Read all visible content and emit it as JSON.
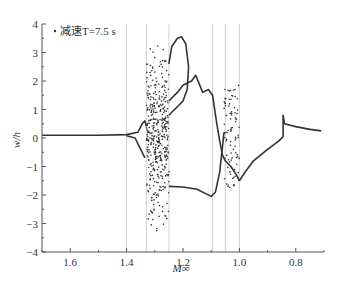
{
  "chart_data": {
    "type": "scatter",
    "title": "",
    "xlabel": "M∞",
    "ylabel": "w/h",
    "xlim": [
      1.7,
      0.7
    ],
    "ylim": [
      -4,
      4
    ],
    "x_reversed": true,
    "grid": false,
    "xticks": [
      1.6,
      1.4,
      1.2,
      1.0,
      0.8
    ],
    "xtick_labels": [
      "1.6",
      "1.4",
      "1.2",
      "1.0",
      "0.8"
    ],
    "yticks": [
      -4,
      -3,
      -2,
      -1,
      0,
      1,
      2,
      3,
      4
    ],
    "ytick_labels": [
      "−4",
      "−3",
      "−2",
      "−1",
      "0",
      "1",
      "2",
      "3",
      "4"
    ],
    "legend": {
      "position": "upper-left",
      "entries": [
        {
          "marker": "dot",
          "label": "减速T=7.5 s"
        }
      ]
    },
    "vertical_reference_lines": [
      1.4,
      1.33,
      1.25,
      1.095,
      1.05,
      1.0
    ],
    "series": [
      {
        "name": "stable-branch-left",
        "style": "line",
        "points": [
          [
            1.7,
            0.1
          ],
          [
            1.5,
            0.1
          ],
          [
            1.4,
            0.12
          ],
          [
            1.36,
            0.2
          ],
          [
            1.345,
            0.5
          ],
          [
            1.335,
            0.6
          ],
          [
            1.33,
            0.4
          ]
        ]
      },
      {
        "name": "stable-branch-left-lower",
        "style": "line",
        "points": [
          [
            1.4,
            0.08
          ],
          [
            1.37,
            0.0
          ],
          [
            1.35,
            -0.4
          ],
          [
            1.335,
            -0.7
          ]
        ]
      },
      {
        "name": "chaotic-band",
        "style": "scatter",
        "x_range": [
          1.33,
          1.25
        ],
        "y_range": [
          -3.7,
          3.9
        ]
      },
      {
        "name": "lower-branch",
        "style": "line",
        "points": [
          [
            1.25,
            -1.7
          ],
          [
            1.2,
            -1.72
          ],
          [
            1.15,
            -1.8
          ],
          [
            1.12,
            -1.95
          ],
          [
            1.1,
            -2.05
          ],
          [
            1.085,
            -1.9
          ],
          [
            1.07,
            -1.2
          ],
          [
            1.06,
            -0.3
          ],
          [
            1.055,
            0.2
          ]
        ]
      },
      {
        "name": "upper-loop",
        "style": "line",
        "points": [
          [
            1.25,
            2.6
          ],
          [
            1.24,
            3.2
          ],
          [
            1.22,
            3.5
          ],
          [
            1.205,
            3.55
          ],
          [
            1.19,
            3.3
          ],
          [
            1.18,
            2.5
          ],
          [
            1.185,
            1.7
          ],
          [
            1.2,
            1.3
          ],
          [
            1.22,
            1.1
          ],
          [
            1.24,
            0.9
          ],
          [
            1.25,
            0.8
          ]
        ]
      },
      {
        "name": "middle-branch",
        "style": "line",
        "points": [
          [
            1.25,
            1.3
          ],
          [
            1.22,
            1.6
          ],
          [
            1.2,
            1.85
          ],
          [
            1.17,
            2.0
          ],
          [
            1.155,
            2.2
          ],
          [
            1.13,
            1.6
          ],
          [
            1.11,
            1.7
          ],
          [
            1.095,
            1.5
          ],
          [
            1.08,
            0.5
          ],
          [
            1.07,
            -0.1
          ],
          [
            1.06,
            -0.6
          ],
          [
            1.05,
            -0.8
          ],
          [
            1.03,
            -1.0
          ],
          [
            1.01,
            -1.3
          ],
          [
            1.0,
            -1.5
          ]
        ]
      },
      {
        "name": "dotted-branches",
        "style": "scatter",
        "x_range": [
          1.055,
          1.0
        ],
        "y_range": [
          -1.8,
          1.9
        ]
      },
      {
        "name": "right-branch",
        "style": "line",
        "points": [
          [
            1.0,
            -1.5
          ],
          [
            0.98,
            -1.2
          ],
          [
            0.95,
            -0.8
          ],
          [
            0.9,
            -0.4
          ],
          [
            0.86,
            -0.1
          ],
          [
            0.845,
            0.05
          ],
          [
            0.845,
            0.8
          ],
          [
            0.84,
            0.5
          ],
          [
            0.8,
            0.4
          ],
          [
            0.75,
            0.3
          ],
          [
            0.71,
            0.25
          ]
        ]
      }
    ]
  }
}
